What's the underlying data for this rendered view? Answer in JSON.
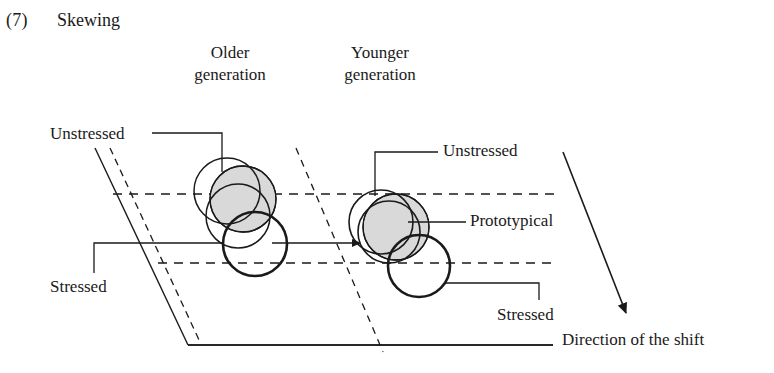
{
  "example": {
    "number": "(7)",
    "title": "Skewing"
  },
  "labels": {
    "older_generation_line1": "Older",
    "older_generation_line2": "generation",
    "younger_generation_line1": "Younger",
    "younger_generation_line2": "generation",
    "unstressed_left": "Unstressed",
    "stressed_left": "Stressed",
    "unstressed_right": "Unstressed",
    "prototypical": "Prototypical",
    "stressed_right": "Stressed",
    "direction_of_shift": "Direction of the shift"
  },
  "colors": {
    "stroke": "#1a1a1a",
    "prototypical_fill": "#d9d9d9",
    "background": "#ffffff"
  },
  "diagram": {
    "type": "vowel-space-skewing-schematic",
    "frame": {
      "shape": "parallelogram",
      "left_edge_solid": true,
      "left_edge_dashed_parallel": true,
      "bottom_edge_solid": true,
      "midline_divider_dashed": true,
      "horizontal_guides_dashed": 2
    },
    "clusters": [
      {
        "name": "older-generation",
        "circles": [
          {
            "role": "unstressed",
            "fill": "none",
            "stroke_weight": "thin"
          },
          {
            "role": "prototypical",
            "fill": "gray",
            "stroke_weight": "thin"
          },
          {
            "role": "stressed",
            "fill": "none",
            "stroke_weight": "thick"
          }
        ],
        "spread": "wide"
      },
      {
        "name": "younger-generation",
        "circles": [
          {
            "role": "unstressed",
            "fill": "none",
            "stroke_weight": "thin"
          },
          {
            "role": "prototypical",
            "fill": "gray",
            "stroke_weight": "thin"
          },
          {
            "role": "stressed",
            "fill": "none",
            "stroke_weight": "thick"
          }
        ],
        "spread": "compressed"
      }
    ],
    "arrows": [
      {
        "name": "shift-arrow-horizontal",
        "direction": "right"
      },
      {
        "name": "direction-of-shift-arrow",
        "direction": "down-right"
      }
    ]
  }
}
